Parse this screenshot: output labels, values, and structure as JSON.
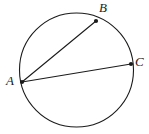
{
  "figure": {
    "type": "geometry-diagram",
    "background_color": "#ffffff",
    "stroke_color": "#1b1b1b",
    "canvas": {
      "width": 149,
      "height": 134
    }
  },
  "circle": {
    "name": "circle",
    "center_x": 76.5,
    "center_y": 70,
    "radius": 57,
    "stroke_color": "#1b1b1b",
    "stroke_width": 1.1,
    "fill": "none"
  },
  "points": [
    {
      "id": "A",
      "label": "A",
      "x": 22,
      "y": 82,
      "dot_radius": 2.1,
      "label_x": 6,
      "label_y": 74
    },
    {
      "id": "B",
      "label": "B",
      "x": 96,
      "y": 21,
      "dot_radius": 2.1,
      "label_x": 99,
      "label_y": 1
    },
    {
      "id": "C",
      "label": "C",
      "x": 131,
      "y": 64,
      "dot_radius": 2.1,
      "label_x": 135,
      "label_y": 55
    }
  ],
  "segments": [
    {
      "id": "AB",
      "from": "A",
      "to": "B",
      "x1": 22,
      "y1": 82,
      "x2": 96,
      "y2": 21,
      "stroke_width": 1.1
    },
    {
      "id": "AC",
      "from": "A",
      "to": "C",
      "x1": 22,
      "y1": 82,
      "x2": 131,
      "y2": 64,
      "stroke_width": 1.1
    }
  ],
  "labels": {
    "A": "A",
    "B": "B",
    "C": "C"
  }
}
